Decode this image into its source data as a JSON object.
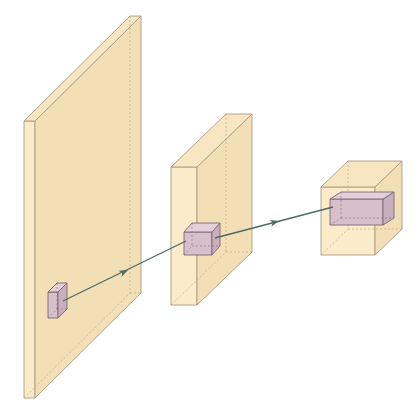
{
  "diagram": {
    "title": "",
    "type": "convolution-receptive-field-3d",
    "colors": {
      "background": "#ffffff",
      "slab_fill": "#fbebc9",
      "slab_side": "#f3dfb6",
      "slab_top": "#f7e6c0",
      "slab_edge": "#a99c86",
      "kernel_fill": "#d7bfcc",
      "kernel_side": "#c9afbe",
      "kernel_top": "#e2cfd9",
      "kernel_edge": "#7d6674",
      "arrow": "#4b6b63"
    },
    "layers": [
      {
        "name": "input-layer",
        "front": [
          24,
          121,
          35,
          398
        ],
        "depth": [
          106,
          -105
        ]
      },
      {
        "name": "hidden-layer",
        "front": [
          171,
          167,
          197,
          305
        ],
        "depth": [
          55,
          -53
        ]
      },
      {
        "name": "output-layer",
        "front": [
          321,
          187,
          375,
          255
        ],
        "depth": [
          27,
          -26
        ]
      }
    ],
    "kernels": [
      {
        "name": "input-kernel",
        "front": [
          48,
          292,
          58,
          318
        ],
        "depth": [
          9,
          -9
        ]
      },
      {
        "name": "hidden-kernel",
        "front": [
          184,
          232,
          212,
          255
        ],
        "depth": [
          8,
          -9
        ]
      },
      {
        "name": "output-kernel",
        "front": [
          330,
          199,
          383,
          225
        ],
        "depth": [
          11,
          -7
        ]
      }
    ],
    "arrows": [
      {
        "name": "arrow-input-to-hidden",
        "from": [
          63,
          301
        ],
        "to": [
          186,
          241
        ],
        "head": [
          128,
          270
        ]
      },
      {
        "name": "arrow-hidden-to-output",
        "from": [
          215,
          238
        ],
        "to": [
          333,
          207
        ],
        "head": [
          279,
          221
        ]
      }
    ]
  }
}
